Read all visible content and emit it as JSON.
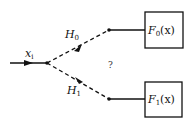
{
  "diagram": {
    "input": {
      "label": "x",
      "subscript": "i"
    },
    "branches": [
      {
        "label": "H",
        "subscript": "0",
        "box": {
          "label": "F",
          "subscript": "0",
          "arg": "(x)"
        }
      },
      {
        "label": "H",
        "subscript": "1",
        "box": {
          "label": "F",
          "subscript": "1",
          "arg": "(x)"
        }
      }
    ],
    "center_mark": "?"
  },
  "colors": {
    "stroke": "#111111",
    "background": "#ffffff"
  }
}
